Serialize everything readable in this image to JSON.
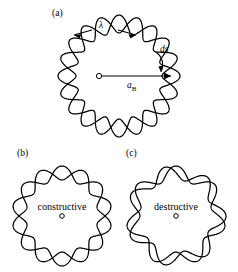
{
  "figure": {
    "background_color": "#ffffff",
    "stroke_color": "#000000",
    "panels": [
      {
        "id": "a",
        "label": "(a)",
        "annotations": {
          "wavelength_symbol": "λ",
          "radius_label_main": "a",
          "radius_label_sub": "B",
          "arc_element": "ds"
        },
        "wave": {
          "lobes": 10,
          "closed": true,
          "mean_radius": 52,
          "amplitude": 9
        }
      },
      {
        "id": "b",
        "label": "(b)",
        "caption": "constructive",
        "wave": {
          "lobes": 7,
          "closed": true,
          "mean_radius": 43,
          "amplitude": 7
        }
      },
      {
        "id": "c",
        "label": "(c)",
        "caption": "destructive",
        "wave": {
          "lobes": 7,
          "closed": false,
          "phase_offset_deg": 25,
          "mean_radius": 43,
          "amplitude": 7
        }
      }
    ]
  },
  "chart_data": {
    "type": "line",
    "xlabel": "",
    "ylabel": "",
    "series": [
      {
        "name": "panel-a-standing-wave",
        "description": "closed standing wave with 10 wavelengths around the orbit",
        "lobes": 10,
        "mean_radius": 52,
        "amplitude": 9,
        "phase_offset_deg": 0
      },
      {
        "name": "panel-b-constructive",
        "description": "integer number of wavelengths, wave closes on itself",
        "lobes": 7,
        "mean_radius": 43,
        "amplitude": 7,
        "phase_offset_deg": 0
      },
      {
        "name": "panel-c-destructive",
        "description": "non-integer number of wavelengths, wave does not close",
        "lobes": 7,
        "mean_radius": 43,
        "amplitude": 7,
        "phase_offset_deg": 25
      }
    ],
    "annotations": [
      "λ",
      "a_B",
      "ds",
      "constructive",
      "destructive",
      "(a)",
      "(b)",
      "(c)"
    ],
    "grid": false,
    "legend": "none"
  }
}
